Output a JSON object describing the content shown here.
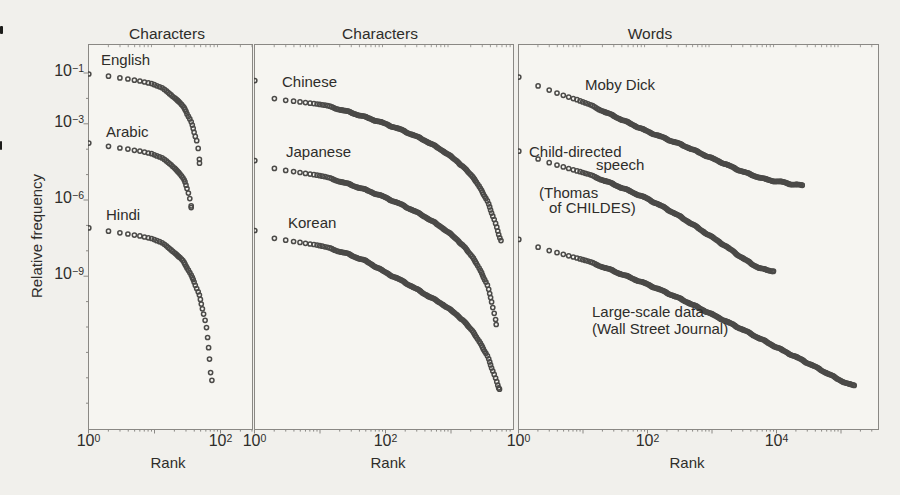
{
  "figure": {
    "ylabel": "Relative frequency",
    "colors": {
      "marker": "#3d3c3a",
      "axis": "#8a8884",
      "text": "#2e2d2a",
      "paper": "#f1f0ec",
      "panel_fill": "#f6f5f1"
    },
    "scan_marks": [
      {
        "x": 0,
        "y": 26,
        "w": 3,
        "h": 8
      },
      {
        "x": 0,
        "y": 141,
        "w": 2,
        "h": 9
      }
    ]
  },
  "chart_data": {
    "type": "scatter",
    "scale": "log-log",
    "marker": "open-circle",
    "ylabel": "Relative frequency",
    "ylim_exp": [
      0.15,
      -15.0
    ],
    "ytick_exponents": [
      -1,
      -3,
      -6,
      -9
    ],
    "panels": [
      {
        "title": "Characters",
        "xlabel": "Rank",
        "xlim_log": [
          0,
          2.49
        ],
        "xtick_exponents": [
          0,
          2
        ],
        "series": [
          {
            "name": "English",
            "points": [
              [
                1,
                -1.04
              ],
              [
                2,
                -1.12
              ],
              [
                3,
                -1.18
              ],
              [
                4,
                -1.22
              ],
              [
                6,
                -1.3
              ],
              [
                9,
                -1.42
              ],
              [
                13,
                -1.6
              ],
              [
                18,
                -1.85
              ],
              [
                24,
                -2.15
              ],
              [
                30,
                -2.5
              ],
              [
                35,
                -2.85
              ],
              [
                39,
                -3.2
              ],
              [
                42,
                -3.5
              ],
              [
                44,
                -3.7
              ],
              [
                45,
                -3.78
              ],
              [
                46,
                -4.15
              ],
              [
                47,
                -4.3
              ],
              [
                48,
                -4.55
              ]
            ]
          },
          {
            "name": "Arabic",
            "points": [
              [
                1,
                -3.76
              ],
              [
                2,
                -3.88
              ],
              [
                3,
                -3.94
              ],
              [
                4,
                -3.98
              ],
              [
                6,
                -4.06
              ],
              [
                9,
                -4.18
              ],
              [
                13,
                -4.36
              ],
              [
                18,
                -4.6
              ],
              [
                24,
                -4.95
              ],
              [
                29,
                -5.3
              ],
              [
                32,
                -5.6
              ],
              [
                34,
                -5.9
              ],
              [
                35,
                -6.1
              ],
              [
                36,
                -6.3
              ]
            ]
          },
          {
            "name": "Hindi",
            "points": [
              [
                1,
                -7.1
              ],
              [
                2,
                -7.22
              ],
              [
                3,
                -7.28
              ],
              [
                4,
                -7.32
              ],
              [
                6,
                -7.4
              ],
              [
                9,
                -7.52
              ],
              [
                13,
                -7.7
              ],
              [
                18,
                -7.95
              ],
              [
                25,
                -8.3
              ],
              [
                32,
                -8.7
              ],
              [
                40,
                -9.2
              ],
              [
                48,
                -9.8
              ],
              [
                55,
                -10.4
              ],
              [
                60,
                -10.9
              ],
              [
                64,
                -11.5
              ],
              [
                68,
                -12.1
              ],
              [
                71,
                -12.7
              ],
              [
                74,
                -13.1
              ]
            ]
          }
        ],
        "annotations": [
          {
            "text": "English",
            "x": 101,
            "y": 52
          },
          {
            "text": "Arabic",
            "x": 106,
            "y": 124
          },
          {
            "text": "Hindi",
            "x": 106,
            "y": 207
          }
        ]
      },
      {
        "title": "Characters",
        "xlabel": "Rank",
        "xlim_log": [
          0,
          3.95
        ],
        "xtick_exponents": [
          0,
          2
        ],
        "series": [
          {
            "name": "Chinese",
            "points": [
              [
                1,
                -1.3
              ],
              [
                2,
                -2.0
              ],
              [
                3,
                -2.06
              ],
              [
                5,
                -2.12
              ],
              [
                8,
                -2.2
              ],
              [
                14,
                -2.32
              ],
              [
                25,
                -2.5
              ],
              [
                50,
                -2.74
              ],
              [
                100,
                -3.0
              ],
              [
                200,
                -3.3
              ],
              [
                400,
                -3.65
              ],
              [
                800,
                -4.1
              ],
              [
                1500,
                -4.65
              ],
              [
                2500,
                -5.3
              ],
              [
                3500,
                -6.0
              ],
              [
                4500,
                -6.7
              ],
              [
                5300,
                -7.3
              ],
              [
                5800,
                -7.6
              ]
            ]
          },
          {
            "name": "Japanese",
            "points": [
              [
                1,
                -4.45
              ],
              [
                2,
                -4.75
              ],
              [
                3,
                -4.82
              ],
              [
                5,
                -4.9
              ],
              [
                8,
                -5.0
              ],
              [
                14,
                -5.14
              ],
              [
                25,
                -5.34
              ],
              [
                50,
                -5.6
              ],
              [
                100,
                -5.9
              ],
              [
                200,
                -6.25
              ],
              [
                400,
                -6.65
              ],
              [
                800,
                -7.15
              ],
              [
                1500,
                -7.75
              ],
              [
                2500,
                -8.5
              ],
              [
                3500,
                -9.3
              ],
              [
                4200,
                -10.0
              ],
              [
                4700,
                -10.6
              ],
              [
                4900,
                -10.9
              ]
            ]
          },
          {
            "name": "Korean",
            "points": [
              [
                1,
                -7.2
              ],
              [
                2,
                -7.5
              ],
              [
                3,
                -7.57
              ],
              [
                5,
                -7.65
              ],
              [
                8,
                -7.75
              ],
              [
                14,
                -7.9
              ],
              [
                25,
                -8.1
              ],
              [
                50,
                -8.4
              ],
              [
                100,
                -8.85
              ],
              [
                200,
                -9.25
              ],
              [
                400,
                -9.7
              ],
              [
                800,
                -10.15
              ],
              [
                1500,
                -10.7
              ],
              [
                2500,
                -11.4
              ],
              [
                3500,
                -12.1
              ],
              [
                4500,
                -12.8
              ],
              [
                5200,
                -13.3
              ],
              [
                5500,
                -13.45
              ]
            ]
          }
        ],
        "annotations": [
          {
            "text": "Chinese",
            "x": 282,
            "y": 74
          },
          {
            "text": "Japanese",
            "x": 286,
            "y": 144
          },
          {
            "text": "Korean",
            "x": 288,
            "y": 215
          }
        ]
      },
      {
        "title": "Words",
        "xlabel": "Rank",
        "xlim_log": [
          0,
          5.58
        ],
        "xtick_exponents": [
          0,
          2,
          4
        ],
        "series": [
          {
            "name": "Moby Dick",
            "points": [
              [
                1,
                -1.16
              ],
              [
                2,
                -1.5
              ],
              [
                3,
                -1.66
              ],
              [
                5,
                -1.86
              ],
              [
                8,
                -2.05
              ],
              [
                14,
                -2.3
              ],
              [
                25,
                -2.6
              ],
              [
                50,
                -2.95
              ],
              [
                100,
                -3.3
              ],
              [
                200,
                -3.6
              ],
              [
                400,
                -3.9
              ],
              [
                800,
                -4.25
              ],
              [
                1500,
                -4.55
              ],
              [
                2500,
                -4.8
              ],
              [
                4000,
                -5.0
              ],
              [
                6000,
                -5.15
              ],
              [
                9000,
                -5.25
              ],
              [
                13000,
                -5.3
              ],
              [
                17000,
                -5.38
              ],
              [
                25000,
                -5.42
              ]
            ]
          },
          {
            "name": "Child-directed speech (Thomas of CHILDES)",
            "points": [
              [
                1,
                -4.08
              ],
              [
                2,
                -4.38
              ],
              [
                3,
                -4.52
              ],
              [
                5,
                -4.68
              ],
              [
                8,
                -4.85
              ],
              [
                14,
                -5.05
              ],
              [
                25,
                -5.3
              ],
              [
                50,
                -5.62
              ],
              [
                100,
                -5.95
              ],
              [
                200,
                -6.35
              ],
              [
                400,
                -6.8
              ],
              [
                800,
                -7.3
              ],
              [
                1500,
                -7.75
              ],
              [
                2500,
                -8.15
              ],
              [
                4000,
                -8.5
              ],
              [
                5500,
                -8.68
              ],
              [
                7000,
                -8.76
              ],
              [
                9000,
                -8.8
              ]
            ]
          },
          {
            "name": "Large-scale data (Wall Street Journal)",
            "points": [
              [
                1,
                -7.55
              ],
              [
                2,
                -7.85
              ],
              [
                3,
                -7.98
              ],
              [
                5,
                -8.12
              ],
              [
                8,
                -8.28
              ],
              [
                14,
                -8.48
              ],
              [
                25,
                -8.72
              ],
              [
                50,
                -9.02
              ],
              [
                100,
                -9.32
              ],
              [
                200,
                -9.65
              ],
              [
                400,
                -10.0
              ],
              [
                800,
                -10.38
              ],
              [
                1500,
                -10.72
              ],
              [
                3000,
                -11.1
              ],
              [
                6000,
                -11.5
              ],
              [
                12000,
                -11.9
              ],
              [
                25000,
                -12.3
              ],
              [
                50000,
                -12.7
              ],
              [
                90000,
                -13.05
              ],
              [
                130000,
                -13.25
              ],
              [
                160000,
                -13.3
              ]
            ]
          }
        ],
        "annotations": [
          {
            "text": "Moby Dick",
            "x": 585,
            "y": 77
          },
          {
            "text": "Child-directed",
            "x": 529,
            "y": 144
          },
          {
            "text": "speech",
            "x": 596,
            "y": 157
          },
          {
            "text": "(Thomas",
            "x": 539,
            "y": 185
          },
          {
            "text": "of CHILDES)",
            "x": 549,
            "y": 200
          },
          {
            "text": "Large-scale data",
            "x": 592,
            "y": 304
          },
          {
            "text": "(Wall Street Journal)",
            "x": 592,
            "y": 321
          }
        ]
      }
    ]
  }
}
